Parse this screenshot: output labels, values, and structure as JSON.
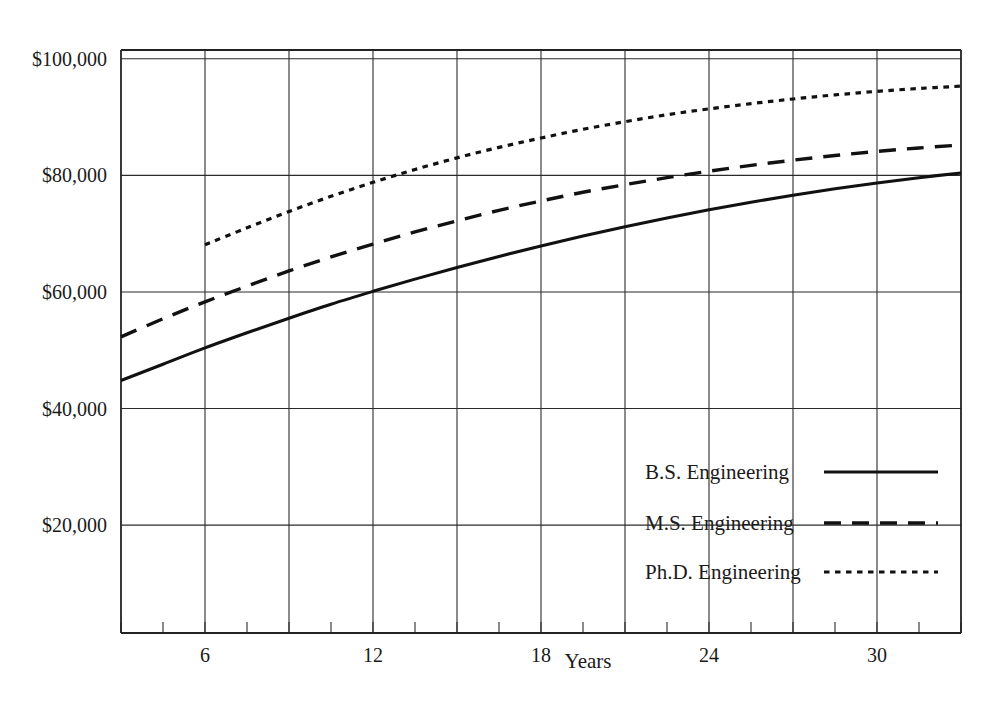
{
  "chart_data": {
    "type": "line",
    "title": "",
    "subtitle": "",
    "xlabel": "Years",
    "ylabel": "",
    "xlim": [
      3,
      33
    ],
    "ylim": [
      1500,
      101500
    ],
    "grid": true,
    "legend_position": "inside-bottom-right",
    "x_ticks_labeled": [
      6,
      12,
      18,
      24,
      30
    ],
    "x_tick_labels": [
      "6",
      "12",
      "18",
      "24",
      "30"
    ],
    "x_gridlines": [
      6,
      9,
      12,
      15,
      18,
      21,
      24,
      27,
      30,
      33
    ],
    "x_minor_tick_step": 1.5,
    "y_ticks": [
      20000,
      40000,
      60000,
      80000,
      100000
    ],
    "y_tick_labels": [
      "$20,000",
      "$40,000",
      "$60,000",
      "$80,000",
      "$100,000"
    ],
    "x": [
      3,
      4.5,
      6,
      7.5,
      9,
      10.5,
      12,
      13.5,
      15,
      16.5,
      18,
      19.5,
      21,
      22.5,
      24,
      25.5,
      27,
      28.5,
      30,
      31.5,
      33
    ],
    "series": [
      {
        "name": "B.S. Engineering",
        "style": "solid",
        "values": [
          44800,
          47600,
          50400,
          53000,
          55500,
          57900,
          60100,
          62200,
          64200,
          66100,
          67900,
          69600,
          71200,
          72700,
          74100,
          75400,
          76600,
          77700,
          78700,
          79600,
          80400
        ]
      },
      {
        "name": "M.S. Engineering",
        "style": "dashed",
        "values": [
          52300,
          55400,
          58300,
          61000,
          63600,
          66000,
          68200,
          70300,
          72200,
          74000,
          75600,
          77100,
          78400,
          79600,
          80700,
          81700,
          82600,
          83400,
          84100,
          84700,
          85200
        ]
      },
      {
        "name": "Ph.D. Engineering",
        "style": "dotted",
        "values": [
          null,
          null,
          68100,
          71000,
          73800,
          76400,
          78800,
          81000,
          83000,
          84800,
          86400,
          87900,
          89200,
          90400,
          91400,
          92300,
          93100,
          93800,
          94400,
          94900,
          95300
        ]
      }
    ],
    "legend": [
      {
        "label": "B.S. Engineering",
        "style": "solid"
      },
      {
        "label": "M.S. Engineering",
        "style": "dashed"
      },
      {
        "label": "Ph.D. Engineering",
        "style": "dotted"
      }
    ],
    "colors": {
      "line": "#111111",
      "grid": "#2b2b2b",
      "axis": "#232323",
      "text": "#1a1a1a",
      "background": "#ffffff"
    }
  }
}
